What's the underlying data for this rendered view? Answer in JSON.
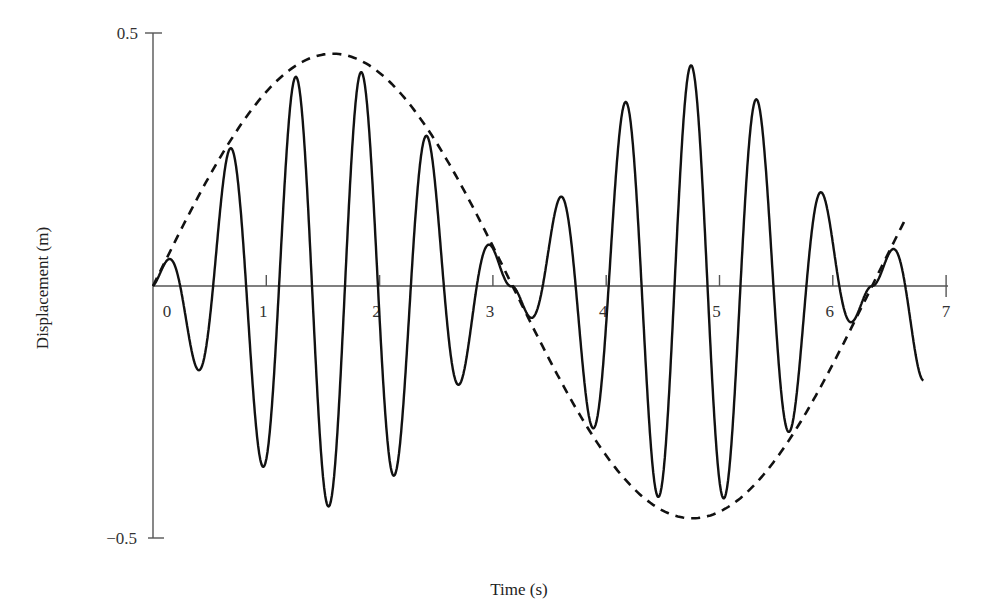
{
  "chart_data": {
    "type": "line",
    "title": "",
    "xlabel": "Time (s)",
    "ylabel": "Displacement (m)",
    "xlim": [
      0,
      7
    ],
    "ylim": [
      -0.5,
      0.5
    ],
    "x_ticks": [
      0,
      1,
      2,
      3,
      4,
      5,
      6,
      7
    ],
    "x_tick_labels": [
      "0",
      "1",
      "2",
      "3",
      "4",
      "5",
      "6",
      "7"
    ],
    "y_ticks": [
      -0.5,
      0.5
    ],
    "y_tick_labels": [
      "−0.5",
      "0.5"
    ],
    "grid": false,
    "legend": null,
    "series": [
      {
        "name": "displacement",
        "style": "solid",
        "color": "#111111",
        "model": "x(t) = A * sin(w_env * t) * sin(w_fast * t + phi)",
        "params": {
          "A": 0.46,
          "w_env": 0.99,
          "w_fast": 10.8,
          "phi": 0.55
        },
        "t_range": [
          0,
          6.8
        ],
        "approx_extrema": [
          {
            "t": 0.15,
            "x": 0.07
          },
          {
            "t": 0.45,
            "x": -0.19
          },
          {
            "t": 0.73,
            "x": 0.33
          },
          {
            "t": 1.0,
            "x": -0.38
          },
          {
            "t": 1.28,
            "x": 0.43
          },
          {
            "t": 1.6,
            "x": -0.45
          },
          {
            "t": 1.87,
            "x": 0.43
          },
          {
            "t": 2.15,
            "x": -0.38
          },
          {
            "t": 2.44,
            "x": 0.33
          },
          {
            "t": 2.72,
            "x": -0.19
          },
          {
            "t": 3.0,
            "x": 0.08
          },
          {
            "t": 3.35,
            "x": 0.08
          },
          {
            "t": 3.62,
            "x": -0.19
          },
          {
            "t": 3.9,
            "x": 0.3
          },
          {
            "t": 4.2,
            "x": -0.37
          },
          {
            "t": 4.45,
            "x": 0.44
          },
          {
            "t": 4.75,
            "x": -0.45
          },
          {
            "t": 5.03,
            "x": 0.44
          },
          {
            "t": 5.3,
            "x": -0.36
          },
          {
            "t": 5.6,
            "x": 0.3
          },
          {
            "t": 5.88,
            "x": -0.19
          },
          {
            "t": 6.15,
            "x": 0.08
          },
          {
            "t": 6.5,
            "x": 0.08
          },
          {
            "t": 6.8,
            "x": -0.18
          }
        ]
      },
      {
        "name": "envelope",
        "style": "dashed",
        "color": "#111111",
        "model": "x(t) = A * sin(w_env * t)",
        "params": {
          "A": 0.46,
          "w_env": 0.99
        },
        "t_range": [
          0,
          6.65
        ],
        "approx_points": [
          {
            "t": 0,
            "x": 0.0
          },
          {
            "t": 0.8,
            "x": 0.33
          },
          {
            "t": 1.6,
            "x": 0.46
          },
          {
            "t": 2.4,
            "x": 0.31
          },
          {
            "t": 3.17,
            "x": 0.0
          },
          {
            "t": 4.0,
            "x": -0.35
          },
          {
            "t": 4.8,
            "x": -0.45
          },
          {
            "t": 5.6,
            "x": -0.29
          },
          {
            "t": 6.34,
            "x": 0.0
          },
          {
            "t": 6.65,
            "x": 0.18
          }
        ]
      }
    ]
  },
  "plot_geometry": {
    "origin_px": [
      153,
      286
    ],
    "px_per_second": 113.3,
    "px_per_meter": 505
  }
}
